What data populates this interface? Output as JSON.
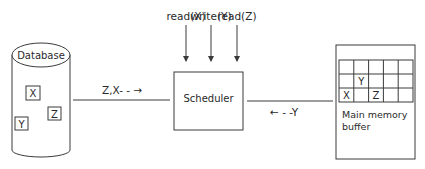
{
  "operations": [
    {
      "label": "read(X)",
      "x": 186
    },
    {
      "label": "write(Y)",
      "x": 211
    },
    {
      "label": "read(Z)",
      "x": 237
    }
  ],
  "database": {
    "label": "Database",
    "items": [
      {
        "label": "X",
        "x": 26,
        "y": 86,
        "w": 14,
        "h": 14
      },
      {
        "label": "Z",
        "x": 48,
        "y": 107,
        "w": 13,
        "h": 13
      },
      {
        "label": "Y",
        "x": 15,
        "y": 117,
        "w": 13,
        "h": 13
      }
    ]
  },
  "scheduler": {
    "label": "Scheduler"
  },
  "flows": {
    "db_to_scheduler": "Z,X- - →",
    "buffer_to_scheduler": "← - -Y"
  },
  "buffer": {
    "label_line1": "Main memory",
    "label_line2": "buffer",
    "grid": {
      "cols": 5,
      "rows": 3,
      "cells": [
        {
          "row": 1,
          "col": 1,
          "label": "Y"
        },
        {
          "row": 2,
          "col": 0,
          "label": "X"
        },
        {
          "row": 2,
          "col": 2,
          "label": "Z"
        }
      ]
    }
  },
  "colors": {
    "stroke": "#3a3a3a",
    "text": "#2a2a2a",
    "background": "#ffffff"
  }
}
